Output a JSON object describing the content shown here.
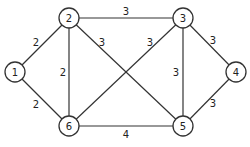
{
  "graph": {
    "type": "weighted-undirected-graph",
    "nodes": [
      {
        "id": "1",
        "label": "1",
        "x": 15,
        "y": 72
      },
      {
        "id": "2",
        "label": "2",
        "x": 69,
        "y": 18
      },
      {
        "id": "3",
        "label": "3",
        "x": 183,
        "y": 18
      },
      {
        "id": "4",
        "label": "4",
        "x": 236,
        "y": 72
      },
      {
        "id": "5",
        "label": "5",
        "x": 183,
        "y": 126
      },
      {
        "id": "6",
        "label": "6",
        "x": 69,
        "y": 126
      }
    ],
    "edges": [
      {
        "from": "1",
        "to": "2",
        "weight": "2",
        "lx": 36,
        "ly": 42
      },
      {
        "from": "1",
        "to": "6",
        "weight": "2",
        "lx": 36,
        "ly": 104
      },
      {
        "from": "2",
        "to": "6",
        "weight": "2",
        "lx": 63,
        "ly": 72
      },
      {
        "from": "2",
        "to": "3",
        "weight": "3",
        "lx": 126,
        "ly": 11
      },
      {
        "from": "2",
        "to": "5",
        "weight": "3",
        "lx": 102,
        "ly": 42
      },
      {
        "from": "6",
        "to": "3",
        "weight": "3",
        "lx": 150,
        "ly": 42
      },
      {
        "from": "3",
        "to": "5",
        "weight": "3",
        "lx": 176,
        "ly": 72
      },
      {
        "from": "3",
        "to": "4",
        "weight": "3",
        "lx": 213,
        "ly": 40
      },
      {
        "from": "4",
        "to": "5",
        "weight": "3",
        "lx": 213,
        "ly": 103
      },
      {
        "from": "6",
        "to": "5",
        "weight": "4",
        "lx": 126,
        "ly": 134
      }
    ],
    "node_radius": 10,
    "colors": {
      "stroke": "#333333",
      "fill": "#ffffff",
      "text": "#222222"
    }
  }
}
